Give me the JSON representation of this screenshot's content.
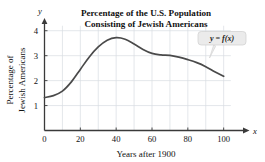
{
  "figure": {
    "title_line1": "Percentage of the U.S. Population",
    "title_line2": "Consisting of Jewish Americans",
    "x_axis_name": "x",
    "y_axis_name": "y",
    "callout_label": "y = f(x)",
    "curve_color": "#4a4a4a",
    "axis_color": "#3a3a3a",
    "grid_color": "#d8dde2",
    "callout_fill": "#ebebeb"
  },
  "chart_data": {
    "type": "line",
    "title": "Percentage of the U.S. Population Consisting of Jewish Americans",
    "xlabel": "Years after 1900",
    "ylabel": "Percentage of Jewish Americans",
    "xlim": [
      0,
      108
    ],
    "ylim": [
      0,
      4.35
    ],
    "xticks": [
      0,
      20,
      40,
      60,
      80,
      100
    ],
    "yticks": [
      1,
      2,
      3,
      4
    ],
    "xtick_labels": [
      "0",
      "20",
      "40",
      "60",
      "80",
      "100"
    ],
    "ytick_labels": [
      "1",
      "2",
      "3",
      "4"
    ],
    "grid": true,
    "grid_x_step": 10,
    "grid_y_step": 1,
    "legend": "y = f(x)",
    "legend_position": "upper-right-callout",
    "series": [
      {
        "name": "y = f(x)",
        "x": [
          0,
          5,
          10,
          15,
          20,
          25,
          30,
          35,
          40,
          45,
          50,
          55,
          60,
          65,
          70,
          75,
          80,
          85,
          90,
          95,
          100
        ],
        "values": [
          1.32,
          1.4,
          1.58,
          1.95,
          2.45,
          2.95,
          3.35,
          3.62,
          3.72,
          3.66,
          3.47,
          3.25,
          3.09,
          3.03,
          3.01,
          2.94,
          2.84,
          2.72,
          2.56,
          2.36,
          2.17
        ]
      }
    ]
  }
}
